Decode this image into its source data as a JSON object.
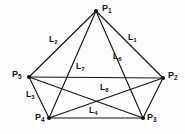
{
  "figure": {
    "type": "undirected-graph-diagram",
    "background_color": "#fdfdfd",
    "stroke_color": "#141414",
    "text_color": "#121212",
    "width": 185,
    "height": 134
  },
  "vertices": [
    {
      "id": "P1",
      "base": "P",
      "sub": "1",
      "x": 96,
      "y": 11,
      "label_x": 102,
      "label_y": 4
    },
    {
      "id": "P2",
      "base": "P",
      "sub": "2",
      "x": 163,
      "y": 78,
      "label_x": 168,
      "label_y": 71
    },
    {
      "id": "P3",
      "base": "P",
      "sub": "3",
      "x": 143,
      "y": 118,
      "label_x": 147,
      "label_y": 113
    },
    {
      "id": "P4",
      "base": "P",
      "sub": "4",
      "x": 49,
      "y": 118,
      "label_x": 35,
      "label_y": 113
    },
    {
      "id": "P5",
      "base": "P",
      "sub": "5",
      "x": 29,
      "y": 77,
      "label_x": 12,
      "label_y": 70
    }
  ],
  "edges": [
    {
      "id": "L1",
      "from": "P1",
      "to": "P2",
      "label": true,
      "base": "L",
      "sub": "1",
      "label_x": 128,
      "label_y": 33
    },
    {
      "id": "L2",
      "from": "P1",
      "to": "P5",
      "label": true,
      "base": "L",
      "sub": "2",
      "label_x": 49,
      "label_y": 35
    },
    {
      "id": "L3",
      "from": "P5",
      "to": "P4",
      "label": true,
      "base": "L",
      "sub": "3",
      "label_x": 26,
      "label_y": 90
    },
    {
      "id": "L4",
      "from": "P4",
      "to": "P3",
      "label": true,
      "base": "L",
      "sub": "4",
      "label_x": 89,
      "label_y": 106
    },
    {
      "id": "L5",
      "from": "P2",
      "to": "P3",
      "label": false,
      "base": "L",
      "sub": "5",
      "label_x": 0,
      "label_y": 0
    },
    {
      "id": "L6",
      "from": "P1",
      "to": "P3",
      "label": true,
      "base": "L",
      "sub": "6",
      "label_x": 113,
      "label_y": 52
    },
    {
      "id": "L7",
      "from": "P1",
      "to": "P4",
      "label": true,
      "base": "L",
      "sub": "7",
      "label_x": 76,
      "label_y": 62
    },
    {
      "id": "L8",
      "from": "P5",
      "to": "P2",
      "label": true,
      "base": "L",
      "sub": "8",
      "label_x": 100,
      "label_y": 83
    },
    {
      "id": "E9",
      "from": "P5",
      "to": "P3",
      "label": false,
      "base": "L",
      "sub": "9",
      "label_x": 0,
      "label_y": 0
    },
    {
      "id": "E10",
      "from": "P4",
      "to": "P2",
      "label": false,
      "base": "L",
      "sub": "10",
      "label_x": 0,
      "label_y": 0
    }
  ]
}
